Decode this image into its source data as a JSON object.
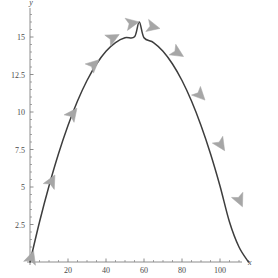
{
  "chart_data": {
    "type": "line",
    "title": "",
    "subtitle": "",
    "xlabel": "x",
    "ylabel": "y",
    "xlim": [
      -4,
      120
    ],
    "ylim": [
      -0.6,
      17.2
    ],
    "grid": false,
    "legend": "none",
    "annotations": "Directional arrowheads placed along the curve indicating direction of travel from left to right.",
    "curve_color": "#3d3d3d",
    "arrow_color": "#a6a6a6",
    "axis_color": "#808080",
    "x_ticks_major": [
      20,
      40,
      60,
      80,
      100
    ],
    "x_tick_labels": [
      "20",
      "40",
      "60",
      "80",
      "100"
    ],
    "x_ticks_minor": [
      5,
      10,
      15,
      25,
      30,
      35,
      45,
      50,
      55,
      65,
      70,
      75,
      85,
      90,
      95,
      105,
      110,
      115
    ],
    "y_ticks_major": [
      2.5,
      5,
      7.5,
      10,
      12.5,
      15
    ],
    "y_tick_labels": [
      "2.5",
      "5",
      "7.5",
      "10",
      "12.5",
      "15"
    ],
    "y_ticks_minor": [
      0.5,
      1,
      1.5,
      2,
      3,
      3.5,
      4,
      4.5,
      5.5,
      6,
      6.5,
      7,
      8,
      8.5,
      9,
      9.5,
      10.5,
      11,
      11.5,
      12,
      13,
      13.5,
      14,
      14.5,
      15.5,
      16,
      16.5
    ],
    "x": [
      0,
      5,
      10,
      15,
      20,
      25,
      30,
      35,
      40,
      45,
      50,
      55,
      57.5,
      60,
      65,
      70,
      75,
      80,
      85,
      90,
      95,
      100,
      105,
      110,
      115
    ],
    "y": [
      0,
      2.67,
      5.07,
      7.22,
      9.1,
      10.73,
      12.1,
      13.2,
      14.05,
      14.63,
      14.95,
      15.01,
      16.0,
      14.95,
      14.63,
      14.05,
      13.2,
      12.1,
      10.73,
      9.1,
      7.22,
      5.07,
      2.67,
      1.0,
      0
    ],
    "arrows": [
      {
        "index": 1,
        "x": 0.5,
        "y": 0.2,
        "angle": -72
      },
      {
        "index": 2,
        "x": 11,
        "y": 5.3,
        "angle": -62
      },
      {
        "index": 3,
        "x": 22,
        "y": 9.8,
        "angle": -53
      },
      {
        "index": 4,
        "x": 33,
        "y": 13.1,
        "angle": -42
      },
      {
        "index": 5,
        "x": 43,
        "y": 14.9,
        "angle": -28
      },
      {
        "index": 6,
        "x": 53,
        "y": 15.9,
        "angle": -11
      },
      {
        "index": 7,
        "x": 64,
        "y": 15.7,
        "angle": 13
      },
      {
        "index": 8,
        "x": 77,
        "y": 14.0,
        "angle": 32
      },
      {
        "index": 9,
        "x": 89,
        "y": 11.2,
        "angle": 46
      },
      {
        "index": 10,
        "x": 100,
        "y": 7.9,
        "angle": 57
      },
      {
        "index": 11,
        "x": 110,
        "y": 4.2,
        "angle": 66
      }
    ]
  },
  "figure": {
    "x_axis_name": "x",
    "y_axis_name": "y"
  }
}
